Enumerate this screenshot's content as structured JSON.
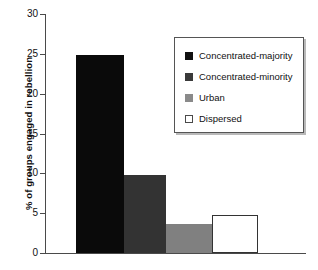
{
  "chart_data": {
    "type": "bar",
    "title": "",
    "subtitle": "",
    "xlabel": "",
    "ylabel": "% of groups engaged in rebellion",
    "ylim": [
      0,
      30
    ],
    "ytick_labels": [
      "30",
      "25",
      "20",
      "15",
      "10",
      "5",
      "0"
    ],
    "ytick_values": [
      30,
      25,
      20,
      15,
      10,
      5,
      0
    ],
    "grid": false,
    "legend_position": "upper-right",
    "categories": [
      "Concentrated-majority",
      "Concentrated-minority",
      "Urban",
      "Dispersed"
    ],
    "values": [
      24.8,
      9.8,
      3.6,
      4.8
    ],
    "bar_colors": [
      "#0a0a0a",
      "#333333",
      "#808080",
      "#ffffff"
    ],
    "bar_edge_colors": [
      "#0a0a0a",
      "#333333",
      "#808080",
      "#333333"
    ],
    "xtick_labels": [
      "",
      "",
      "",
      ""
    ],
    "annotations": []
  },
  "legend": {
    "items": [
      {
        "label": "Concentrated-majority",
        "color": "#111111",
        "border": "#111111"
      },
      {
        "label": "Concentrated-minority",
        "color": "#3a3a3a",
        "border": "#3a3a3a"
      },
      {
        "label": "Urban",
        "color": "#8a8a8a",
        "border": "#8a8a8a"
      },
      {
        "label": "Dispersed",
        "color": "#ffffff",
        "border": "#4a4a4a"
      }
    ]
  }
}
